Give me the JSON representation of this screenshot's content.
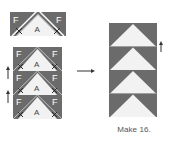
{
  "figure": {
    "type": "quilt-block-assembly-diagram",
    "colors": {
      "dark": "#6b6b6b",
      "light": "#f2f2f2",
      "line": "#ffffff",
      "stitch_mark": "#2a2a2a",
      "arrow": "#333333",
      "text_on_dark": "#ffffff",
      "text_on_light": "#444444"
    },
    "step1": {
      "label_square_left": "F",
      "label_square_right": "F",
      "label_rectangle": "A"
    },
    "step2": {
      "units": [
        {
          "left": "F",
          "center": "A",
          "right": "F"
        },
        {
          "left": "F",
          "center": "A",
          "right": "F"
        },
        {
          "left": "F",
          "center": "A",
          "right": "F"
        }
      ],
      "press_arrows": [
        "up",
        "up"
      ]
    },
    "result": {
      "rows": 4,
      "press_arrow": "up"
    },
    "caption": "Make 16."
  }
}
